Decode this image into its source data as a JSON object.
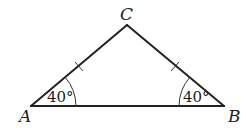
{
  "diagram": {
    "type": "isosceles-triangle",
    "vertices": {
      "A": {
        "label": "A",
        "x": 31,
        "y": 106
      },
      "B": {
        "label": "B",
        "x": 224,
        "y": 106
      },
      "C": {
        "label": "C",
        "x": 127,
        "y": 25
      }
    },
    "angles": {
      "A": {
        "label": "40°"
      },
      "B": {
        "label": "40°"
      }
    },
    "congruent_sides": [
      "AC",
      "BC"
    ],
    "colors": {
      "stroke": "#222222",
      "background": "#ffffff"
    }
  }
}
